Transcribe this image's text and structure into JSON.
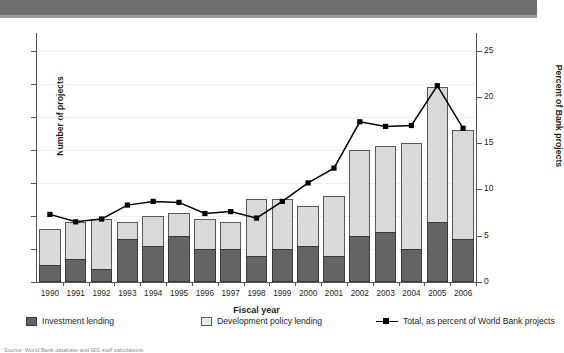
{
  "header": {
    "band_color": "#6e6e6e"
  },
  "axes": {
    "left_title": "Number of projects",
    "right_title": "Percent of Bank projects",
    "x_title": "Fiscal year",
    "left_ticks": [
      "0",
      "10",
      "20",
      "30",
      "40",
      "50",
      "60",
      "70"
    ],
    "right_ticks": [
      "0",
      "5",
      "10",
      "15",
      "20",
      "25"
    ]
  },
  "legend": {
    "items": [
      {
        "label": "Investment lending",
        "type": "swatch",
        "color": "#636466"
      },
      {
        "label": "Development policy lending",
        "type": "swatch",
        "color": "#e9e9e9"
      },
      {
        "label": "Total, as percent of World Bank projects",
        "type": "line-marker",
        "color": "#000000"
      }
    ]
  },
  "source": "Source: World Bank database and IEG staff calculations.",
  "chart_data": {
    "type": "bar",
    "title": "",
    "subtitle": "",
    "xlabel": "Fiscal year",
    "ylabel": "Number of projects",
    "y2label": "Percent of Bank projects",
    "ylim": [
      0,
      70
    ],
    "y2lim": [
      0,
      25
    ],
    "grid": true,
    "legend_position": "bottom",
    "stacked": true,
    "categories": [
      "1990",
      "1991",
      "1992",
      "1993",
      "1994",
      "1995",
      "1996",
      "1997",
      "1998",
      "1999",
      "2000",
      "2001",
      "2002",
      "2003",
      "2004",
      "2005",
      "2006"
    ],
    "series": [
      {
        "name": "Investment lending",
        "axis": "left",
        "kind": "bar",
        "color": "#636466",
        "values": [
          5,
          7,
          4,
          13,
          11,
          14,
          10,
          10,
          8,
          10,
          11,
          8,
          14,
          15,
          10,
          18,
          13
        ]
      },
      {
        "name": "Development policy lending",
        "axis": "left",
        "kind": "bar",
        "color": "#e9e9e9",
        "values": [
          11,
          11,
          15,
          5,
          9,
          7,
          9,
          8,
          17,
          15,
          12,
          18,
          26,
          26,
          32,
          41,
          33
        ]
      },
      {
        "name": "Total, as percent of World Bank projects",
        "axis": "right",
        "kind": "line",
        "color": "#000000",
        "values": [
          7.3,
          6.5,
          6.8,
          8.3,
          8.7,
          8.6,
          7.4,
          7.6,
          6.9,
          8.7,
          10.7,
          12.3,
          17.3,
          16.8,
          16.9,
          21.2,
          16.6
        ]
      }
    ],
    "bar_totals": [
      16,
      18,
      19,
      18,
      20,
      21,
      19,
      18,
      25,
      25,
      23,
      26,
      40,
      41,
      42,
      59,
      46
    ]
  }
}
